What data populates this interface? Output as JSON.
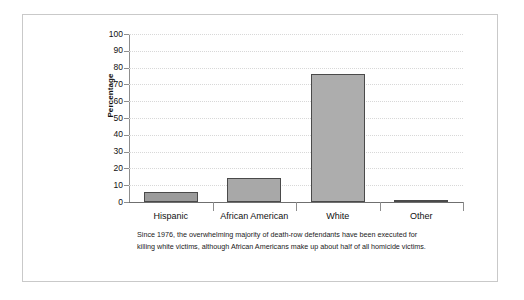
{
  "figure": {
    "caption": "Since 1976, the overwhelming majority of death-row defendants have been executed for killing white victims, although African Americans make up about half of all homicide victims."
  },
  "chart_data": {
    "type": "bar",
    "title": "",
    "xlabel": "",
    "ylabel": "Percentage",
    "categories": [
      "Hispanic",
      "African American",
      "White",
      "Other"
    ],
    "values": [
      6,
      14.5,
      76,
      1
    ],
    "ylim": [
      0,
      100
    ],
    "yticks": [
      0,
      10,
      20,
      30,
      40,
      50,
      60,
      70,
      80,
      90,
      100
    ],
    "ytick_labels": [
      "0",
      "10",
      "20",
      "30",
      "40",
      "50",
      "60",
      "70",
      "80",
      "90",
      "100"
    ],
    "grid": true,
    "legend": false,
    "bar_color": "#a3a3a3",
    "bar_border_color": "#4a4a4a",
    "gridline_color": "#d8d8d8",
    "axis_color": "#6f6f6f"
  }
}
